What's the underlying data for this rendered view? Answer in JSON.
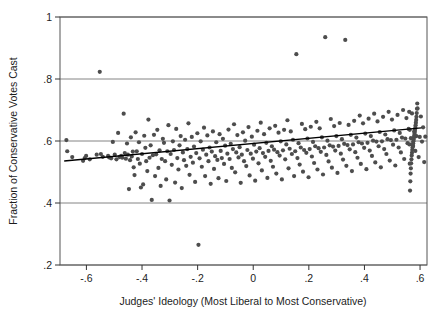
{
  "chart_data": {
    "type": "scatter",
    "title": "",
    "xlabel": "Judges' Ideology (Most Liberal to Most Conservative)",
    "ylabel": "Fraction of Conservative Votes Cast",
    "xlim": [
      -0.695,
      0.625
    ],
    "ylim": [
      0.2,
      1.0
    ],
    "xticks": [
      -0.6,
      -0.4,
      -0.2,
      0,
      0.2,
      0.4,
      0.6
    ],
    "xticklabels": [
      "-.6",
      "-.4",
      "-.2",
      "0",
      ".2",
      ".4",
      ".6"
    ],
    "yticks": [
      0.2,
      0.4,
      0.6,
      0.8,
      1.0
    ],
    "yticklabels": [
      ".2",
      ".4",
      ".6",
      ".8",
      "1"
    ],
    "grid": "horizontal-gridlines-at-yticks",
    "legend": "none",
    "marker_color": "#4d4d4d",
    "marker_size_px": 4.2,
    "line_color": "#000000",
    "frame_color": "#555555",
    "gridline_color": "#777777",
    "background": "#ffffff",
    "fit_line": {
      "label": "linear fit",
      "x": [
        -0.68,
        0.605
      ],
      "y": [
        0.5355,
        0.6425
      ],
      "slope": 0.0833,
      "intercept": 0.5921
    },
    "x": [
      -0.672,
      -0.669,
      -0.651,
      -0.612,
      -0.606,
      -0.601,
      -0.588,
      -0.563,
      -0.552,
      -0.548,
      -0.541,
      -0.522,
      -0.518,
      -0.511,
      -0.505,
      -0.498,
      -0.492,
      -0.486,
      -0.481,
      -0.475,
      -0.471,
      -0.466,
      -0.462,
      -0.458,
      -0.454,
      -0.451,
      -0.447,
      -0.443,
      -0.44,
      -0.437,
      -0.433,
      -0.43,
      -0.427,
      -0.423,
      -0.419,
      -0.415,
      -0.411,
      -0.408,
      -0.404,
      -0.4,
      -0.396,
      -0.392,
      -0.388,
      -0.385,
      -0.381,
      -0.377,
      -0.373,
      -0.369,
      -0.365,
      -0.361,
      -0.357,
      -0.353,
      -0.349,
      -0.345,
      -0.341,
      -0.337,
      -0.333,
      -0.329,
      -0.325,
      -0.321,
      -0.317,
      -0.313,
      -0.309,
      -0.305,
      -0.301,
      -0.297,
      -0.293,
      -0.289,
      -0.285,
      -0.281,
      -0.277,
      -0.273,
      -0.269,
      -0.265,
      -0.261,
      -0.257,
      -0.253,
      -0.249,
      -0.245,
      -0.241,
      -0.237,
      -0.233,
      -0.229,
      -0.225,
      -0.221,
      -0.217,
      -0.213,
      -0.209,
      -0.205,
      -0.201,
      -0.197,
      -0.193,
      -0.189,
      -0.185,
      -0.181,
      -0.177,
      -0.173,
      -0.169,
      -0.165,
      -0.161,
      -0.157,
      -0.153,
      -0.149,
      -0.145,
      -0.141,
      -0.137,
      -0.133,
      -0.129,
      -0.125,
      -0.121,
      -0.117,
      -0.113,
      -0.109,
      -0.105,
      -0.101,
      -0.097,
      -0.093,
      -0.089,
      -0.085,
      -0.081,
      -0.077,
      -0.073,
      -0.069,
      -0.065,
      -0.061,
      -0.057,
      -0.053,
      -0.049,
      -0.045,
      -0.041,
      -0.037,
      -0.033,
      -0.029,
      -0.025,
      -0.021,
      -0.017,
      -0.013,
      -0.009,
      -0.005,
      -0.001,
      0.003,
      0.007,
      0.011,
      0.015,
      0.019,
      0.023,
      0.027,
      0.031,
      0.035,
      0.039,
      0.043,
      0.047,
      0.051,
      0.055,
      0.059,
      0.063,
      0.067,
      0.071,
      0.075,
      0.079,
      0.083,
      0.087,
      0.091,
      0.095,
      0.099,
      0.103,
      0.107,
      0.111,
      0.115,
      0.119,
      0.123,
      0.127,
      0.131,
      0.135,
      0.139,
      0.143,
      0.147,
      0.151,
      0.155,
      0.159,
      0.163,
      0.167,
      0.171,
      0.175,
      0.179,
      0.183,
      0.187,
      0.191,
      0.195,
      0.199,
      0.203,
      0.207,
      0.211,
      0.215,
      0.219,
      0.223,
      0.227,
      0.231,
      0.235,
      0.239,
      0.243,
      0.247,
      0.251,
      0.255,
      0.259,
      0.263,
      0.267,
      0.271,
      0.275,
      0.279,
      0.283,
      0.287,
      0.291,
      0.295,
      0.299,
      0.303,
      0.307,
      0.311,
      0.315,
      0.319,
      0.323,
      0.327,
      0.331,
      0.335,
      0.339,
      0.343,
      0.347,
      0.351,
      0.355,
      0.359,
      0.363,
      0.367,
      0.371,
      0.375,
      0.379,
      0.383,
      0.387,
      0.391,
      0.395,
      0.399,
      0.403,
      0.407,
      0.411,
      0.415,
      0.419,
      0.423,
      0.427,
      0.431,
      0.435,
      0.439,
      0.443,
      0.447,
      0.451,
      0.455,
      0.459,
      0.463,
      0.467,
      0.471,
      0.475,
      0.479,
      0.483,
      0.487,
      0.491,
      0.495,
      0.499,
      0.503,
      0.507,
      0.511,
      0.515,
      0.519,
      0.523,
      0.527,
      0.531,
      0.535,
      0.539,
      0.543,
      0.547,
      0.551,
      0.555,
      0.559,
      0.563,
      0.567,
      0.571,
      0.575,
      0.579,
      0.583,
      0.587,
      0.591,
      0.595,
      0.599,
      0.603,
      0.607,
      0.611,
      0.615,
      0.619,
      0.561,
      0.562,
      0.563,
      0.564,
      0.565,
      0.566,
      0.567,
      0.568,
      0.569,
      0.57,
      0.571,
      0.572,
      0.573,
      0.574,
      0.575,
      0.576,
      0.577,
      0.578,
      0.579,
      0.58,
      0.581,
      0.582,
      0.583,
      0.584,
      0.585,
      0.586,
      0.587,
      0.588,
      0.589,
      0.59
    ],
    "y": [
      0.603,
      0.567,
      0.548,
      0.536,
      0.545,
      0.552,
      0.541,
      0.556,
      0.823,
      0.558,
      0.549,
      0.552,
      0.547,
      0.544,
      0.597,
      0.556,
      0.541,
      0.626,
      0.548,
      0.552,
      0.546,
      0.688,
      0.561,
      0.543,
      0.592,
      0.556,
      0.445,
      0.538,
      0.612,
      0.55,
      0.566,
      0.515,
      0.49,
      0.628,
      0.567,
      0.542,
      0.596,
      0.527,
      0.45,
      0.558,
      0.46,
      0.617,
      0.578,
      0.535,
      0.503,
      0.669,
      0.546,
      0.586,
      0.41,
      0.554,
      0.62,
      0.487,
      0.557,
      0.636,
      0.513,
      0.57,
      0.455,
      0.542,
      0.607,
      0.594,
      0.535,
      0.476,
      0.567,
      0.651,
      0.408,
      0.558,
      0.523,
      0.599,
      0.571,
      0.466,
      0.639,
      0.545,
      0.508,
      0.586,
      0.616,
      0.448,
      0.563,
      0.538,
      0.604,
      0.52,
      0.574,
      0.657,
      0.491,
      0.549,
      0.613,
      0.53,
      0.582,
      0.468,
      0.561,
      0.625,
      0.265,
      0.544,
      0.599,
      0.517,
      0.572,
      0.643,
      0.487,
      0.556,
      0.618,
      0.535,
      0.579,
      0.462,
      0.566,
      0.631,
      0.51,
      0.551,
      0.596,
      0.539,
      0.48,
      0.622,
      0.568,
      0.545,
      0.607,
      0.526,
      0.585,
      0.471,
      0.559,
      0.637,
      0.542,
      0.591,
      0.513,
      0.574,
      0.654,
      0.499,
      0.563,
      0.619,
      0.547,
      0.58,
      0.465,
      0.556,
      0.628,
      0.535,
      0.601,
      0.519,
      0.571,
      0.645,
      0.489,
      0.559,
      0.614,
      0.543,
      0.588,
      0.472,
      0.566,
      0.633,
      0.528,
      0.577,
      0.659,
      0.505,
      0.561,
      0.622,
      0.549,
      0.594,
      0.481,
      0.568,
      0.641,
      0.536,
      0.583,
      0.517,
      0.572,
      0.649,
      0.495,
      0.564,
      0.627,
      0.553,
      0.599,
      0.476,
      0.57,
      0.636,
      0.541,
      0.589,
      0.667,
      0.512,
      0.575,
      0.631,
      0.558,
      0.604,
      0.487,
      0.567,
      0.88,
      0.545,
      0.593,
      0.524,
      0.579,
      0.655,
      0.501,
      0.571,
      0.638,
      0.562,
      0.608,
      0.483,
      0.574,
      0.646,
      0.55,
      0.597,
      0.529,
      0.583,
      0.662,
      0.508,
      0.577,
      0.641,
      0.565,
      0.612,
      0.492,
      0.579,
      0.935,
      0.555,
      0.601,
      0.534,
      0.586,
      0.671,
      0.514,
      0.582,
      0.648,
      0.569,
      0.616,
      0.497,
      0.584,
      0.658,
      0.559,
      0.606,
      0.54,
      0.591,
      0.926,
      0.52,
      0.587,
      0.652,
      0.573,
      0.62,
      0.503,
      0.589,
      0.665,
      0.564,
      0.611,
      0.546,
      0.596,
      0.682,
      0.526,
      0.592,
      0.657,
      0.578,
      0.624,
      0.509,
      0.594,
      0.672,
      0.569,
      0.616,
      0.552,
      0.601,
      0.688,
      0.531,
      0.598,
      0.663,
      0.583,
      0.629,
      0.515,
      0.599,
      0.678,
      0.574,
      0.621,
      0.558,
      0.606,
      0.694,
      0.537,
      0.603,
      0.669,
      0.588,
      0.634,
      0.521,
      0.604,
      0.684,
      0.579,
      0.626,
      0.563,
      0.611,
      0.7,
      0.542,
      0.608,
      0.674,
      0.593,
      0.639,
      0.527,
      0.609,
      0.689,
      0.584,
      0.631,
      0.568,
      0.616,
      0.705,
      0.548,
      0.613,
      0.679,
      0.598,
      0.644,
      0.532,
      0.614,
      0.694,
      0.589,
      0.636,
      0.44,
      0.47,
      0.495,
      0.512,
      0.528,
      0.541,
      0.553,
      0.562,
      0.571,
      0.579,
      0.586,
      0.593,
      0.599,
      0.605,
      0.611,
      0.617,
      0.623,
      0.629,
      0.636,
      0.643,
      0.651,
      0.659,
      0.668,
      0.678,
      0.69,
      0.704,
      0.721,
      0.742,
      0.77,
      0.81
    ]
  }
}
